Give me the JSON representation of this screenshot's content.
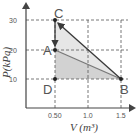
{
  "diagram": {
    "type": "pv-diagram",
    "x_axis": {
      "label": "V (m³)",
      "ticks": [
        "0.50",
        "1.0",
        "1.5"
      ]
    },
    "y_axis": {
      "label": "P(kPa)",
      "ticks": [
        "30",
        "20",
        "10"
      ]
    },
    "points": [
      {
        "name": "A",
        "V": 0.5,
        "P": 20
      },
      {
        "name": "B",
        "V": 1.5,
        "P": 10
      },
      {
        "name": "C",
        "V": 0.5,
        "P": 30
      },
      {
        "name": "D",
        "V": 0.5,
        "P": 10
      }
    ],
    "paths": [
      {
        "from": "B",
        "to": "C",
        "arrow": true
      },
      {
        "from": "C",
        "to": "A",
        "arrow": true
      },
      {
        "from": "A",
        "to": "B",
        "arrow": false
      }
    ],
    "colors": {
      "line_dark": "#3a3a3a",
      "line_mid": "#777777",
      "fill_light": "#e4e4e4",
      "fill_dark": "#cfcfcf",
      "grid": "#555555"
    }
  }
}
